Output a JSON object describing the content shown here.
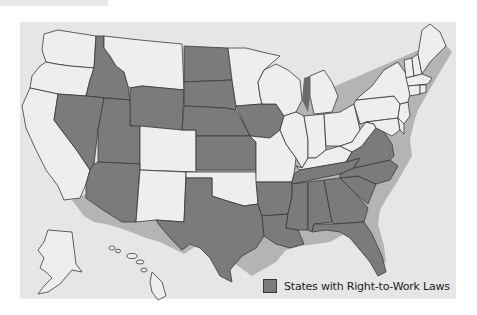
{
  "map": {
    "title": "",
    "legend": {
      "label": "States with Right-to-Work Laws",
      "swatch_color": "#7b7b7b"
    },
    "colors": {
      "right_to_work": "#7b7b7b",
      "other": "#eeeeee",
      "background": "#e6e6e6",
      "border": "#3a3a3a"
    },
    "right_to_work_states": [
      "Idaho",
      "Nevada",
      "Utah",
      "Arizona",
      "Wyoming",
      "North Dakota",
      "South Dakota",
      "Nebraska",
      "Kansas",
      "Iowa",
      "Texas",
      "Arkansas",
      "Louisiana",
      "Mississippi",
      "Alabama",
      "Tennessee",
      "Georgia",
      "Florida",
      "South Carolina",
      "North Carolina",
      "Virginia"
    ],
    "other_states": [
      "Washington",
      "Oregon",
      "California",
      "Montana",
      "Colorado",
      "New Mexico",
      "Oklahoma",
      "Minnesota",
      "Wisconsin",
      "Michigan",
      "Illinois",
      "Indiana",
      "Ohio",
      "Kentucky",
      "West Virginia",
      "Missouri",
      "Pennsylvania",
      "New York",
      "Maryland",
      "Delaware",
      "New Jersey",
      "Connecticut",
      "Rhode Island",
      "Massachusetts",
      "Vermont",
      "New Hampshire",
      "Maine",
      "Alaska",
      "Hawaii"
    ]
  }
}
